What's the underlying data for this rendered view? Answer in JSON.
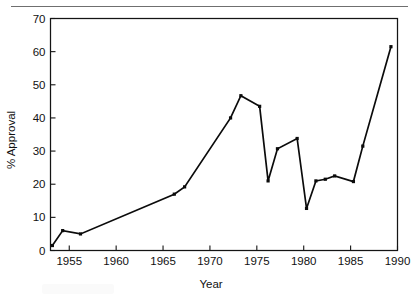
{
  "figure": {
    "has_top_rule": true,
    "background_color": "#ffffff",
    "line_color": "#0b0b0b",
    "axis_color": "#141414",
    "rule_color": "#6f6f6f"
  },
  "chart_data": {
    "type": "line",
    "title": "",
    "subtitle": "",
    "xlabel": "Year",
    "ylabel": "% Approval",
    "xlim": [
      1953,
      1990
    ],
    "ylim": [
      0,
      70
    ],
    "grid": false,
    "legend": null,
    "legend_position": "none",
    "xticks": [
      1955,
      1960,
      1965,
      1970,
      1975,
      1980,
      1985,
      1990
    ],
    "xticklabels": [
      "1955",
      "1960",
      "1965",
      "1970",
      "1975",
      "1980",
      "1985",
      "1990"
    ],
    "yticks": [
      0,
      10,
      20,
      30,
      40,
      50,
      60,
      70
    ],
    "yticklabels": [
      "0",
      "10",
      "20",
      "30",
      "40",
      "50",
      "60",
      "70"
    ],
    "marker": "square",
    "series": [
      {
        "name": "% Approval",
        "x": [
          1953.2,
          1954.3,
          1956.2,
          1966.2,
          1967.3,
          1972.2,
          1973.3,
          1975.3,
          1976.2,
          1977.2,
          1979.3,
          1980.3,
          1981.3,
          1982.3,
          1983.3,
          1985.3,
          1986.3,
          1989.3
        ],
        "values": [
          1.5,
          6.0,
          5.0,
          17.0,
          19.2,
          40.0,
          46.7,
          43.5,
          21.0,
          30.7,
          33.8,
          12.7,
          21.0,
          21.5,
          22.5,
          20.8,
          31.5,
          61.5
        ]
      }
    ],
    "annotations": []
  }
}
